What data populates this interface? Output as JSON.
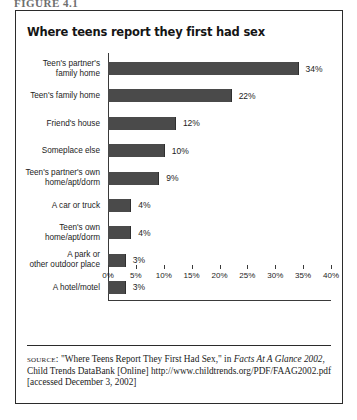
{
  "figure_caption": "FIGURE 4.1",
  "chart_title": "Where teens report they first had sex",
  "colors": {
    "bar_fill": "#4a4a4a",
    "axis": "#3a3a3a",
    "border": "#2b2b2b",
    "text": "#1a1a1a"
  },
  "source_note": {
    "label": "source:",
    "part1": " \"Where Teens Report They First Had Sex,\" in ",
    "italic1": "Facts At A Glance 2002",
    "part2": ", Child Trends DataBank [Online] http://www.childtrends.org/PDF/FAAG2002.pdf [accessed December 3, 2002]"
  },
  "chart_data": {
    "type": "bar",
    "orientation": "horizontal",
    "title": "Where teens report they first had sex",
    "xlabel": "",
    "ylabel": "",
    "xlim": [
      0,
      40
    ],
    "xtick_labels": [
      "0%",
      "5%",
      "10%",
      "15%",
      "20%",
      "25%",
      "30%",
      "35%",
      "40%"
    ],
    "xticks": [
      0,
      5,
      10,
      15,
      20,
      25,
      30,
      35,
      40
    ],
    "grid": false,
    "legend": "none",
    "value_suffix": "%",
    "categories": [
      "Teen's partner's family home",
      "Teen's family home",
      "Friend's house",
      "Someplace else",
      "Teen's partner's own home/apt/dorm",
      "A car or truck",
      "Teen's own home/apt/dorm",
      "A park or other outdoor place",
      "A hotel/motel"
    ],
    "category_lines": [
      [
        "Teen's partner's",
        "family home"
      ],
      [
        "Teen's family home"
      ],
      [
        "Friend's house"
      ],
      [
        "Someplace else"
      ],
      [
        "Teen's partner's own",
        "home/apt/dorm"
      ],
      [
        "A car or truck"
      ],
      [
        "Teen's own",
        "home/apt/dorm"
      ],
      [
        "A park or",
        "other outdoor place"
      ],
      [
        "A hotel/motel"
      ]
    ],
    "values": [
      34,
      22,
      12,
      10,
      9,
      4,
      4,
      3,
      3
    ],
    "value_labels": [
      "34%",
      "22%",
      "12%",
      "10%",
      "9%",
      "4%",
      "4%",
      "3%",
      "3%"
    ]
  }
}
